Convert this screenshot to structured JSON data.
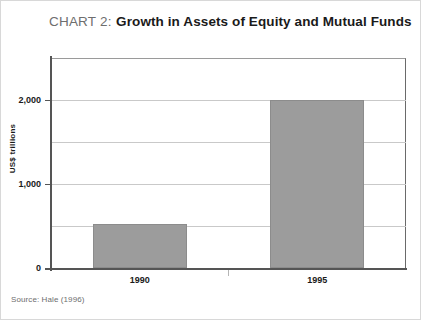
{
  "title": {
    "prefix": "CHART 2:",
    "main": "Growth in Assets of Equity and Mutual Funds"
  },
  "source": {
    "text": "Source: Hale (1996)"
  },
  "colors": {
    "bar_fill": "#9c9c9c",
    "bar_border": "#8c8c8c",
    "gridline": "#c9c9c9",
    "axis": "#555555",
    "title_prefix": "#6e6e6e",
    "title_main": "#1a1a1a",
    "source_text": "#6e6e6e",
    "page_border": "#d8d8d8",
    "background": "#ffffff"
  },
  "chart_data": {
    "type": "bar",
    "title": "CHART 2: Growth in Assets of Equity and Mutual Funds",
    "categories": [
      "1990",
      "1995"
    ],
    "values": [
      520,
      2000
    ],
    "xlabel": "",
    "ylabel": "US$ trillions",
    "ylim": [
      0,
      2500
    ],
    "ytick_values": [
      0,
      1000,
      2000
    ],
    "ytick_labels": [
      "0",
      "1,000",
      "2,000"
    ],
    "gridline_values": [
      500,
      1000,
      1500,
      2000
    ],
    "grid": true,
    "legend": false,
    "source": "Source: Hale (1996)"
  }
}
